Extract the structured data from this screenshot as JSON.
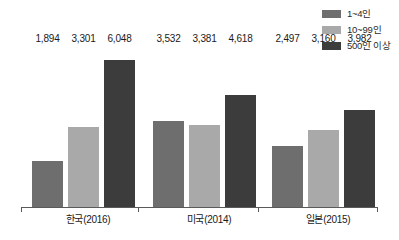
{
  "chart_data": {
    "type": "bar",
    "title": "",
    "subtitle": "",
    "xlabel": "",
    "ylabel": "",
    "grid": false,
    "legend_position": "top-right",
    "ylim": [
      0,
      6600
    ],
    "categories": [
      "한국(2016)",
      "미국(2014)",
      "일본(2015)"
    ],
    "series": [
      {
        "name": "1~4인",
        "color": "#6e6e6e",
        "values": [
          1894,
          3301,
          2497
        ],
        "labels": [
          "1,894",
          "3,301",
          "2,497"
        ]
      },
      {
        "name": "10~99인",
        "color": "#a9a9a9",
        "values": [
          3301,
          3381,
          3160
        ],
        "labels": [
          "3,301",
          "3,381",
          "3,160"
        ]
      },
      {
        "name": "500인 이상",
        "color": "#3c3c3c",
        "values": [
          6048,
          4618,
          3982
        ],
        "labels": [
          "6,048",
          "4,618",
          "3,982"
        ]
      }
    ],
    "groups": [
      {
        "label": "한국(2016)",
        "bars": [
          {
            "series": "1~4인",
            "value": 1894,
            "label": "1,894",
            "color": "#6e6e6e"
          },
          {
            "series": "10~99인",
            "value": 3301,
            "label": "3,301",
            "color": "#a9a9a9"
          },
          {
            "series": "500인 이상",
            "value": 6048,
            "label": "6,048",
            "color": "#3c3c3c"
          }
        ]
      },
      {
        "label": "미국(2014)",
        "bars": [
          {
            "series": "1~4인",
            "value": 3532,
            "label": "3,532",
            "color": "#6e6e6e"
          },
          {
            "series": "10~99인",
            "value": 3381,
            "label": "3,381",
            "color": "#a9a9a9"
          },
          {
            "series": "500인 이상",
            "value": 4618,
            "label": "4,618",
            "color": "#3c3c3c"
          }
        ]
      },
      {
        "label": "일본(2015)",
        "bars": [
          {
            "series": "1~4인",
            "value": 2497,
            "label": "2,497",
            "color": "#6e6e6e"
          },
          {
            "series": "10~99인",
            "value": 3160,
            "label": "3,160",
            "color": "#a9a9a9"
          },
          {
            "series": "500인 이상",
            "value": 3982,
            "label": "3,982",
            "color": "#3c3c3c"
          }
        ]
      }
    ]
  },
  "legend": {
    "items": [
      {
        "label": "1~4인",
        "color": "#6e6e6e"
      },
      {
        "label": "10~99인",
        "color": "#a9a9a9"
      },
      {
        "label": "500인 이상",
        "color": "#3c3c3c"
      }
    ]
  },
  "axis": {
    "line_color": "#5a5a5a",
    "tick_count": 4
  }
}
